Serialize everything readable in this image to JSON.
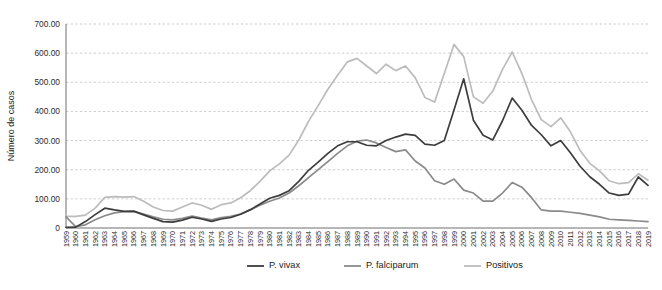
{
  "figure": {
    "background_color": "#ffffff",
    "caption_fragment": ""
  },
  "chart_data": {
    "type": "line",
    "title": "",
    "subtitle": "",
    "xlabel": "",
    "ylabel": "Número de casos",
    "xlim": [
      1959,
      2019
    ],
    "ylim": [
      0,
      700
    ],
    "ytick_step": 100,
    "grid": true,
    "grid_axis": "y",
    "legend_position": "bottom",
    "ytick_labels": [
      "0",
      "100.00",
      "200.00",
      "300.00",
      "400.00",
      "500.00",
      "600.00",
      "700.00"
    ],
    "ytick_values": [
      0,
      100,
      200,
      300,
      400,
      500,
      600,
      700
    ],
    "categories": [
      "1959",
      "1960",
      "1961",
      "1962",
      "1963",
      "1964",
      "1965",
      "1966",
      "1967",
      "1968",
      "1969",
      "1970",
      "1971",
      "1972",
      "1973",
      "1974",
      "1975",
      "1976",
      "1977",
      "1978",
      "1979",
      "1980",
      "1981",
      "1982",
      "1983",
      "1984",
      "1985",
      "1986",
      "1987",
      "1988",
      "1989",
      "1990",
      "1991",
      "1992",
      "1993",
      "1994",
      "1995",
      "1996",
      "1997",
      "1998",
      "1999",
      "2000",
      "2001",
      "2002",
      "2003",
      "2004",
      "2005",
      "2006",
      "2007",
      "2008",
      "2009",
      "2010",
      "2011",
      "2012",
      "2013",
      "2014",
      "2015",
      "2016",
      "2017",
      "2018",
      "2019"
    ],
    "series": [
      {
        "name": "P. vivax",
        "color": "#3d3d3d",
        "width": 1.7,
        "values": [
          2,
          3,
          22,
          46,
          68,
          62,
          57,
          58,
          45,
          33,
          22,
          20,
          27,
          37,
          31,
          23,
          31,
          36,
          47,
          63,
          82,
          102,
          112,
          128,
          160,
          198,
          226,
          256,
          282,
          296,
          296,
          284,
          282,
          300,
          312,
          322,
          318,
          288,
          284,
          300,
          405,
          512,
          370,
          318,
          302,
          368,
          446,
          404,
          352,
          320,
          282,
          300,
          258,
          212,
          176,
          150,
          120,
          112,
          116,
          175,
          146
        ]
      },
      {
        "name": "P. falciparum",
        "color": "#8a8a8a",
        "width": 1.7,
        "values": [
          38,
          5,
          11,
          28,
          42,
          52,
          56,
          56,
          48,
          38,
          30,
          28,
          33,
          41,
          34,
          28,
          36,
          40,
          48,
          62,
          78,
          92,
          103,
          120,
          145,
          173,
          200,
          228,
          256,
          282,
          298,
          302,
          292,
          276,
          262,
          268,
          230,
          206,
          162,
          150,
          168,
          130,
          120,
          92,
          92,
          120,
          156,
          140,
          104,
          62,
          58,
          58,
          54,
          50,
          44,
          38,
          30,
          28,
          26,
          24,
          22
        ]
      },
      {
        "name": "Positivos",
        "color": "#bcbcbc",
        "width": 1.7,
        "values": [
          40,
          40,
          44,
          68,
          105,
          108,
          106,
          108,
          92,
          72,
          60,
          58,
          72,
          86,
          78,
          64,
          80,
          86,
          104,
          128,
          160,
          196,
          220,
          250,
          302,
          366,
          420,
          476,
          524,
          570,
          582,
          556,
          530,
          562,
          540,
          556,
          516,
          448,
          432,
          530,
          630,
          588,
          450,
          428,
          470,
          544,
          604,
          530,
          440,
          372,
          348,
          378,
          330,
          266,
          222,
          196,
          162,
          152,
          156,
          186,
          164
        ]
      }
    ],
    "legend": [
      {
        "label": "P. vivax",
        "color": "#3d3d3d"
      },
      {
        "label": "P. falciparum",
        "color": "#8a8a8a"
      },
      {
        "label": "Positivos",
        "color": "#bcbcbc"
      }
    ]
  }
}
